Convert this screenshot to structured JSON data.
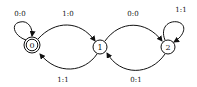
{
  "diagram": {
    "type": "finite-state-machine",
    "states": [
      {
        "id": "0",
        "label": "0",
        "accepting": true
      },
      {
        "id": "1",
        "label": "1",
        "accepting": false
      },
      {
        "id": "2",
        "label": "2",
        "accepting": false
      }
    ],
    "transitions": [
      {
        "from": "0",
        "to": "0",
        "label": "0:0"
      },
      {
        "from": "0",
        "to": "1",
        "label": "1:0"
      },
      {
        "from": "1",
        "to": "0",
        "label": "1:1"
      },
      {
        "from": "1",
        "to": "2",
        "label": "0:0"
      },
      {
        "from": "2",
        "to": "1",
        "label": "0:1"
      },
      {
        "from": "2",
        "to": "2",
        "label": "1:1"
      }
    ]
  }
}
